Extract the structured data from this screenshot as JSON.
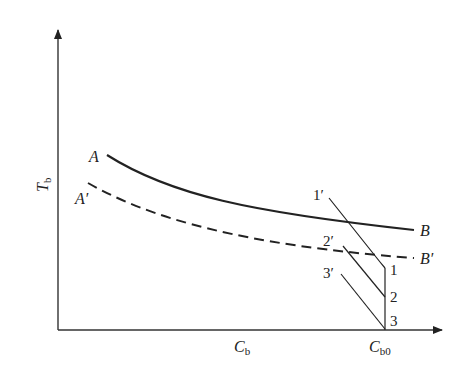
{
  "diagram": {
    "axes": {
      "y_label": "T",
      "y_label_sub": "b",
      "x_label": "C",
      "x_label_sub": "b",
      "x_mark_label": "C",
      "x_mark_sub": "b0"
    },
    "curves": [
      {
        "id": "AB",
        "style": "solid",
        "start_label": "A",
        "end_label": "B"
      },
      {
        "id": "A'B'",
        "style": "dashed",
        "start_label": "A′",
        "end_label": "B′"
      }
    ],
    "operating_lines": [
      {
        "start_label": "1′",
        "end_label": "1"
      },
      {
        "start_label": "2′",
        "end_label": "2"
      },
      {
        "start_label": "3′",
        "end_label": "3"
      }
    ],
    "colors": {
      "line": "#222222",
      "axis": "#333333",
      "background": "#ffffff"
    }
  }
}
